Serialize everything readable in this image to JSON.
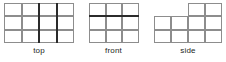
{
  "figure": {
    "colors": {
      "grid_line": "#8d8d8d",
      "thick_line": "#2b2b2b",
      "cell_fill": "#ffffff",
      "label_text": "#231f20",
      "background": "#ffffff"
    },
    "views": [
      {
        "id": "top",
        "label": "top",
        "type": "rectangular-grid",
        "columns": 4,
        "rows": 3,
        "cell_width": 17.5,
        "cell_height": 13.33,
        "cells": [
          {
            "col": 0,
            "row": 0
          },
          {
            "col": 1,
            "row": 0
          },
          {
            "col": 2,
            "row": 0
          },
          {
            "col": 3,
            "row": 0
          },
          {
            "col": 0,
            "row": 1
          },
          {
            "col": 1,
            "row": 1
          },
          {
            "col": 2,
            "row": 1
          },
          {
            "col": 3,
            "row": 1
          },
          {
            "col": 0,
            "row": 2
          },
          {
            "col": 1,
            "row": 2
          },
          {
            "col": 2,
            "row": 2
          },
          {
            "col": 3,
            "row": 2
          }
        ],
        "thick_lines": [
          {
            "orientation": "vertical",
            "at_column": 2,
            "from_row": 0,
            "to_row": 3
          },
          {
            "orientation": "vertical",
            "at_column": 3,
            "from_row": 0,
            "to_row": 3
          }
        ]
      },
      {
        "id": "front",
        "label": "front",
        "type": "rectangular-grid",
        "columns": 3,
        "rows": 3,
        "cell_width": 16.67,
        "cell_height": 13.33,
        "cells": [
          {
            "col": 0,
            "row": 0
          },
          {
            "col": 1,
            "row": 0
          },
          {
            "col": 2,
            "row": 0
          },
          {
            "col": 0,
            "row": 1
          },
          {
            "col": 1,
            "row": 1
          },
          {
            "col": 2,
            "row": 1
          },
          {
            "col": 0,
            "row": 2
          },
          {
            "col": 1,
            "row": 2
          },
          {
            "col": 2,
            "row": 2
          }
        ],
        "thick_lines": [
          {
            "orientation": "horizontal",
            "at_row": 1,
            "from_column": 0,
            "to_column": 3
          }
        ]
      },
      {
        "id": "side",
        "label": "side",
        "type": "irregular-grid",
        "columns": 4,
        "rows": 3,
        "cell_width": 17,
        "cell_height": 13.33,
        "cells": [
          {
            "col": 2,
            "row": 0
          },
          {
            "col": 3,
            "row": 0
          },
          {
            "col": 0,
            "row": 1
          },
          {
            "col": 1,
            "row": 1
          },
          {
            "col": 2,
            "row": 1
          },
          {
            "col": 3,
            "row": 1
          },
          {
            "col": 0,
            "row": 2
          },
          {
            "col": 1,
            "row": 2
          },
          {
            "col": 2,
            "row": 2
          },
          {
            "col": 3,
            "row": 2
          }
        ],
        "thick_lines": []
      }
    ]
  }
}
